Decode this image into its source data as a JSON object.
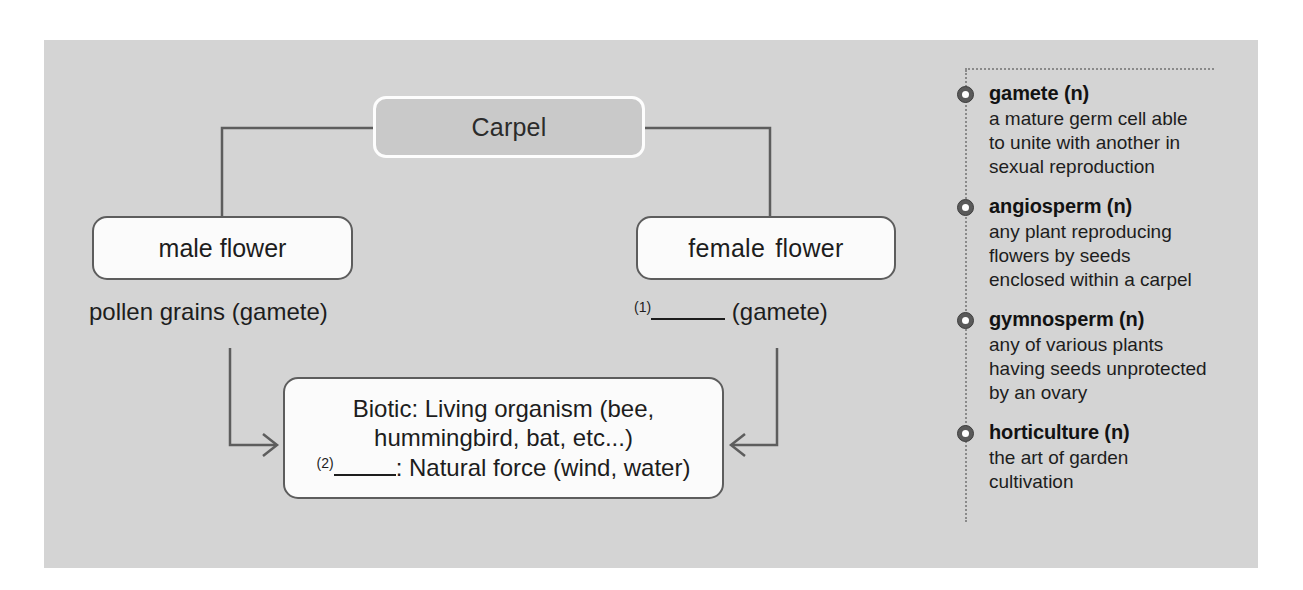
{
  "colors": {
    "panel_bg": "#d4d4d4",
    "page_bg": "#ffffff",
    "node_fill": "#fbfbfb",
    "node_border": "#5d5d5d",
    "carpel_fill": "#c9c9c9",
    "carpel_border": "#fdfdfd",
    "text": "#1d1d1d",
    "dotted_rule": "#8a8a8a",
    "bullet": "#5a5a5a"
  },
  "diagram": {
    "title_node": {
      "label": "Carpel"
    },
    "male_node": {
      "label": "male flower"
    },
    "female_node": {
      "label_part1": "female",
      "label_part2": "flower"
    },
    "male_caption": "pollen grains (gamete)",
    "female_caption": {
      "blank_number": "(1)",
      "blank_answer": "",
      "suffix": "(gamete)"
    },
    "vector_node": {
      "line1": "Biotic: Living organism (bee,",
      "line2": "hummingbird, bat, etc...)",
      "line3_blank_number": "(2)",
      "line3_blank_answer": "",
      "line3_suffix": ": Natural force (wind, water)"
    }
  },
  "glossary": {
    "entries": [
      {
        "term": "gamete (n)",
        "definition_lines": [
          "a mature germ cell able",
          "to unite with another in",
          "sexual reproduction"
        ]
      },
      {
        "term": "angiosperm (n)",
        "definition_lines": [
          "any plant reproducing",
          "flowers by seeds",
          "enclosed within a carpel"
        ]
      },
      {
        "term": "gymnosperm (n)",
        "definition_lines": [
          "any of various plants",
          "having seeds unprotected",
          "by an ovary"
        ]
      },
      {
        "term": "horticulture (n)",
        "definition_lines": [
          "the art of garden",
          "cultivation"
        ]
      }
    ]
  }
}
